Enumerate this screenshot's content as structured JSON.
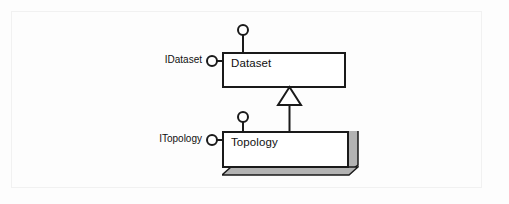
{
  "canvas": {
    "width": 509,
    "height": 204,
    "background_color": "#fdfdfd",
    "frame_border_color": "#f1f1f1"
  },
  "diagram": {
    "type": "uml-class-diagram",
    "line_color": "#1a1a1a",
    "fill_color": "#ffffff",
    "extrusion_color": "#b3b3b3",
    "classes": [
      {
        "id": "dataset",
        "name": "Dataset",
        "shape": "rectangle",
        "provided_interfaces": [
          {
            "name": "",
            "position": "top",
            "icon": "lollipop-icon"
          },
          {
            "name": "IDataset",
            "position": "left",
            "icon": "lollipop-icon"
          }
        ]
      },
      {
        "id": "topology",
        "name": "Topology",
        "shape": "extruded-rectangle",
        "provided_interfaces": [
          {
            "name": "",
            "position": "top",
            "icon": "lollipop-icon"
          },
          {
            "name": "ITopology",
            "position": "left",
            "icon": "lollipop-icon"
          }
        ]
      }
    ],
    "relationships": [
      {
        "type": "generalization",
        "source": "Topology",
        "target": "Dataset",
        "arrowhead": "hollow-triangle"
      }
    ]
  }
}
